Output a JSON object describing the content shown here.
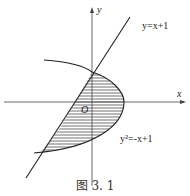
{
  "figure": {
    "y_axis_label": "y",
    "x_axis_label": "x",
    "origin_label": "O",
    "line_label": "y=x+1",
    "parabola_label": "y²=-x+1",
    "caption": "图 3. 1"
  }
}
